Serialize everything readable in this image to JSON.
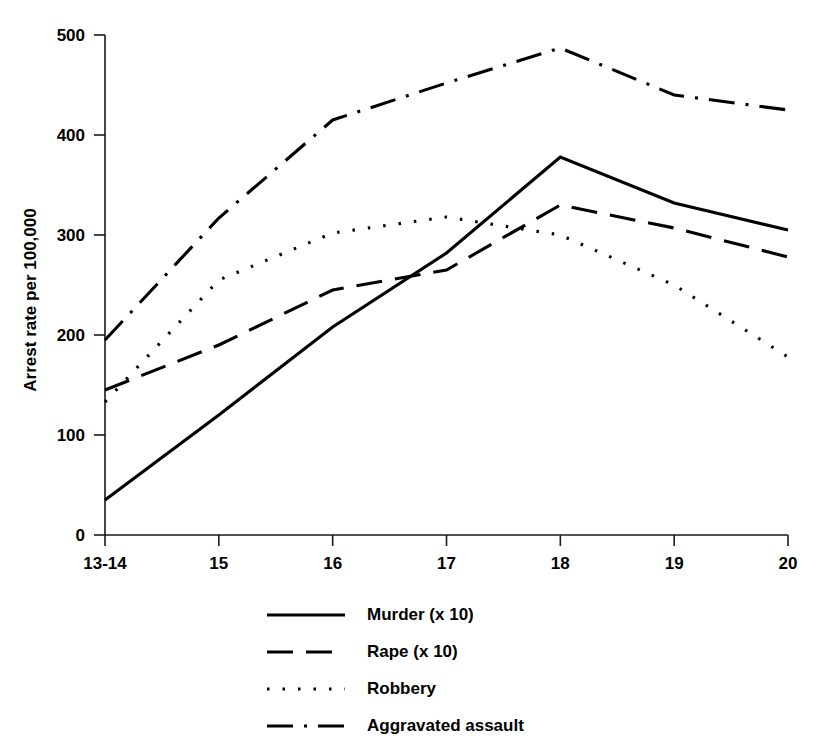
{
  "chart_data": {
    "type": "line",
    "title": "",
    "xlabel": "",
    "ylabel": "Arrest rate per 100,000",
    "categories": [
      "13-14",
      "15",
      "16",
      "17",
      "18",
      "19",
      "20"
    ],
    "x_tick_labels": [
      "13-14",
      "15",
      "16",
      "17",
      "18",
      "19",
      "20"
    ],
    "y_tick_labels": [
      "0",
      "100",
      "200",
      "300",
      "400",
      "500"
    ],
    "y_ticks": [
      0,
      100,
      200,
      300,
      400,
      500
    ],
    "ylim": [
      0,
      500
    ],
    "grid": false,
    "legend_position": "bottom-center",
    "series": [
      {
        "name": "Murder (x 10)",
        "style": "solid",
        "values": [
          35,
          120,
          208,
          282,
          378,
          332,
          305
        ]
      },
      {
        "name": "Rape (x 10)",
        "style": "dashed",
        "values": [
          145,
          190,
          245,
          265,
          330,
          307,
          278
        ]
      },
      {
        "name": "Robbery",
        "style": "dotted",
        "values": [
          133,
          255,
          302,
          318,
          300,
          250,
          178
        ]
      },
      {
        "name": "Aggravated assault",
        "style": "dashdot",
        "values": [
          195,
          317,
          415,
          452,
          487,
          440,
          425
        ]
      }
    ]
  },
  "legend": {
    "items": [
      {
        "label": "Murder (x 10)",
        "style": "solid"
      },
      {
        "label": "Rape (x 10)",
        "style": "dashed"
      },
      {
        "label": "Robbery",
        "style": "dotted"
      },
      {
        "label": "Aggravated assault",
        "style": "dashdot"
      }
    ]
  },
  "colors": {
    "ink": "#000000",
    "axis": "#1a1a1a",
    "background": "#ffffff"
  }
}
